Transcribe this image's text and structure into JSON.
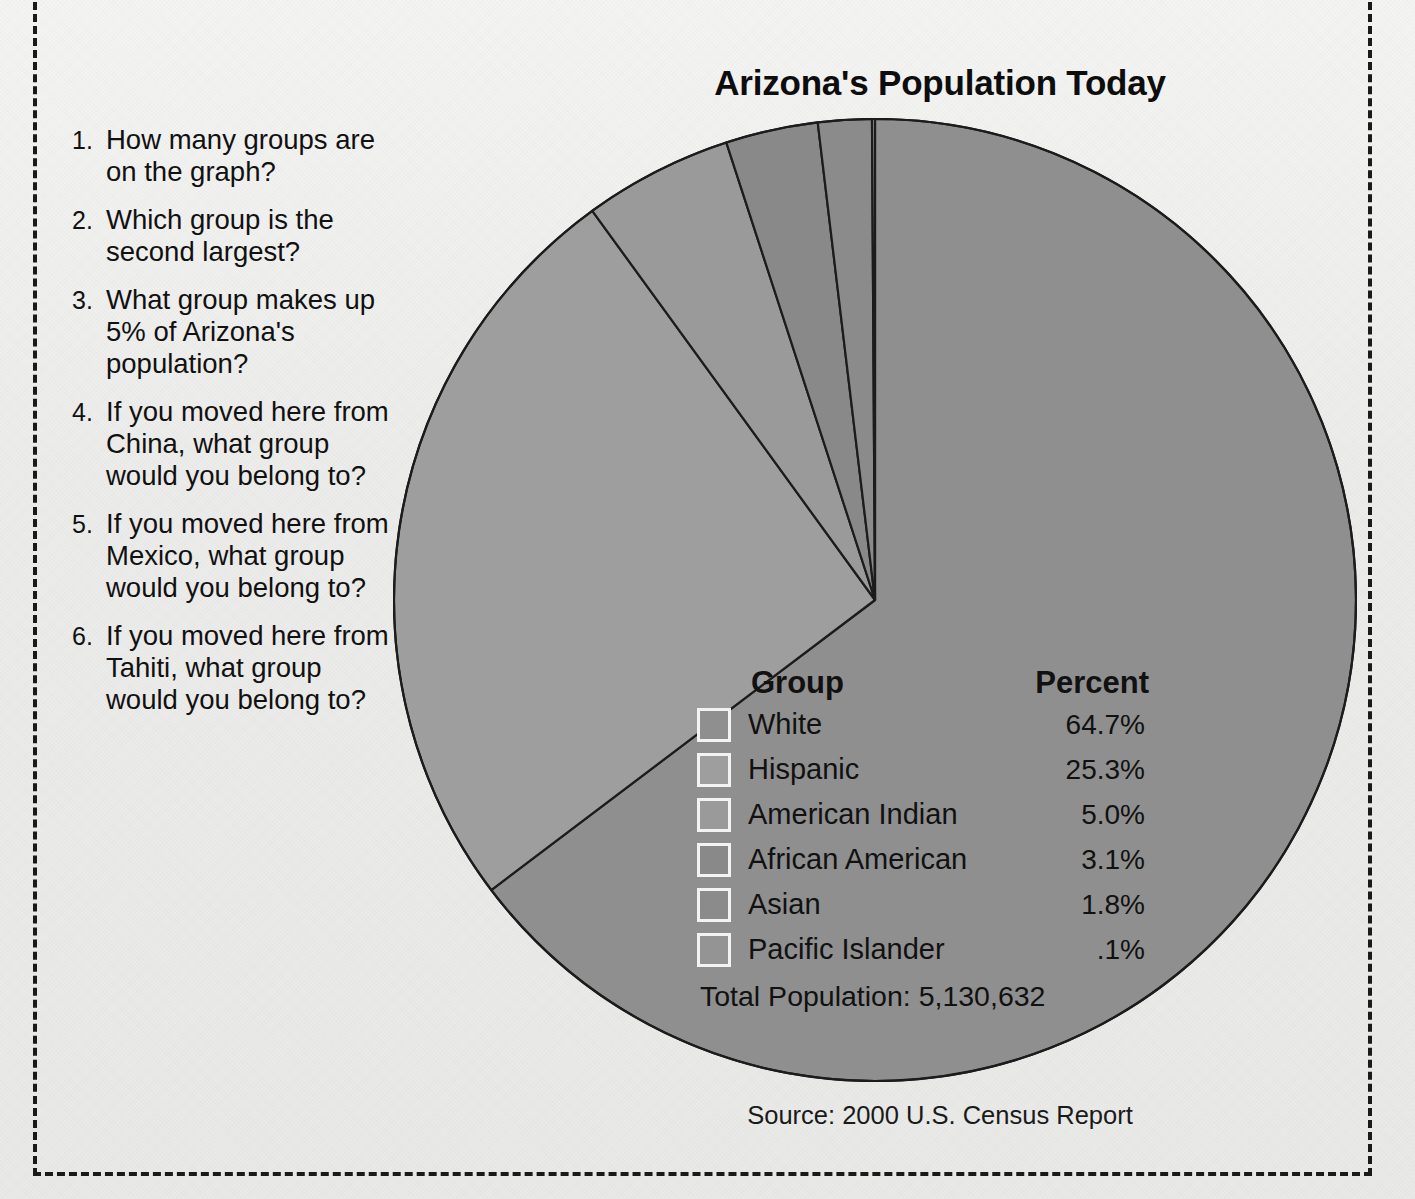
{
  "page": {
    "background_color": "#ececeb",
    "border_style": "dashed-cut-line"
  },
  "top_cropped_text": "",
  "chart": {
    "title": "Arizona's Population Today",
    "source": "Source: 2000 U.S. Census Report",
    "total_label": "Total Population: 5,130,632"
  },
  "legend": {
    "header_group": "Group",
    "header_percent": "Percent",
    "rows": [
      {
        "label": "White",
        "percent": "64.7%",
        "color": "#8f8f8f"
      },
      {
        "label": "Hispanic",
        "percent": "25.3%",
        "color": "#9e9e9e"
      },
      {
        "label": "American Indian",
        "percent": "5.0%",
        "color": "#9a9a9a"
      },
      {
        "label": "African American",
        "percent": "3.1%",
        "color": "#898989"
      },
      {
        "label": "Asian",
        "percent": "1.8%",
        "color": "#8b8b8b"
      },
      {
        "label": "Pacific Islander",
        "percent": ".1%",
        "color": "#949494"
      }
    ]
  },
  "questions": [
    {
      "num": "1.",
      "text": "How many groups are on the graph?"
    },
    {
      "num": "2.",
      "text": "Which group is the second largest?"
    },
    {
      "num": "3.",
      "text": "What group makes up 5% of Arizona's population?"
    },
    {
      "num": "4.",
      "text": "If you moved here from China, what group would you belong to?"
    },
    {
      "num": "5.",
      "text": "If you moved here from Mexico, what group would you belong to?"
    },
    {
      "num": "6.",
      "text": "If you moved here from Tahiti, what group would you belong to?"
    }
  ],
  "chart_data": {
    "type": "pie",
    "title": "Arizona's Population Today",
    "categories": [
      "White",
      "Hispanic",
      "American Indian",
      "African American",
      "Asian",
      "Pacific Islander"
    ],
    "values": [
      64.7,
      25.3,
      5.0,
      3.1,
      1.8,
      0.1
    ],
    "value_labels": [
      "64.7%",
      "25.3%",
      "5.0%",
      "3.1%",
      "1.8%",
      ".1%"
    ],
    "colors": [
      "#8f8f8f",
      "#9e9e9e",
      "#9a9a9a",
      "#898989",
      "#8b8b8b",
      "#949494"
    ],
    "units": "percent",
    "total": "5,130,632",
    "total_label": "Total Population: 5,130,632",
    "source": "Source: 2000 U.S. Census Report",
    "start_angle_deg": 0,
    "direction": "clockwise",
    "legend_position": "inside-lower-right",
    "stroke_color": "#1c1c1c",
    "grid": false
  }
}
